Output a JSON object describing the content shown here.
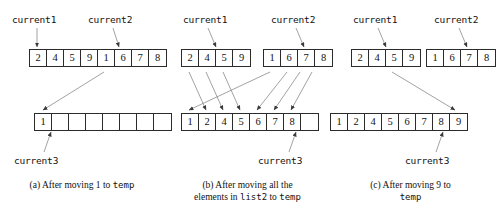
{
  "figure": {
    "line_color": "#777777",
    "box_border_color": "#2b2b2b",
    "background": "#ffffff"
  },
  "panels": [
    {
      "id": "a",
      "labels": {
        "current1": "current1",
        "current2": "current2",
        "current3": "current3"
      },
      "list1": {
        "name": "list1",
        "cells": [
          "2",
          "4",
          "5",
          "9"
        ],
        "pointer_index": 0
      },
      "list2": {
        "name": "list2",
        "cells": [
          "1",
          "6",
          "7",
          "8"
        ],
        "pointer_index": 1
      },
      "temp": {
        "name": "temp",
        "cells": [
          "1",
          "",
          "",
          "",
          "",
          "",
          "",
          ""
        ],
        "pointer_index": 1
      },
      "caption": {
        "line1_pre": "(a) After moving 1 to ",
        "line1_mono": "temp",
        "line1_post": "",
        "line2_pre": "",
        "line2_mono": "",
        "line2_post": ""
      }
    },
    {
      "id": "b",
      "labels": {
        "current1": "current1",
        "current2": "current2",
        "current3": "current3"
      },
      "list1": {
        "name": "list1",
        "cells": [
          "2",
          "4",
          "5",
          "9"
        ],
        "pointer_index": 3
      },
      "list2": {
        "name": "list2",
        "cells": [
          "1",
          "6",
          "7",
          "8"
        ],
        "pointer_index": 3
      },
      "temp": {
        "name": "temp",
        "cells": [
          "1",
          "2",
          "4",
          "5",
          "6",
          "7",
          "8",
          ""
        ],
        "pointer_index": 6
      },
      "caption": {
        "line1_pre": "(b) After moving all the",
        "line1_mono": "",
        "line1_post": "",
        "line2_pre": "elements in ",
        "line2_mono": "list2",
        "line2_post": " to ",
        "line2_mono2": "temp"
      }
    },
    {
      "id": "c",
      "labels": {
        "current1": "current1",
        "current2": "current2",
        "current3": "current3"
      },
      "list1": {
        "name": "list1",
        "cells": [
          "2",
          "4",
          "5",
          "9"
        ],
        "pointer_index": 3
      },
      "list2": {
        "name": "list2",
        "cells": [
          "1",
          "6",
          "7",
          "8"
        ],
        "pointer_index": 3
      },
      "temp": {
        "name": "temp",
        "cells": [
          "1",
          "2",
          "4",
          "5",
          "6",
          "7",
          "8",
          "9"
        ],
        "pointer_index": 6
      },
      "caption": {
        "line1_pre": "(c) After moving 9 to",
        "line1_mono": "",
        "line1_post": "",
        "line2_pre": "",
        "line2_mono": "temp",
        "line2_post": ""
      }
    }
  ]
}
